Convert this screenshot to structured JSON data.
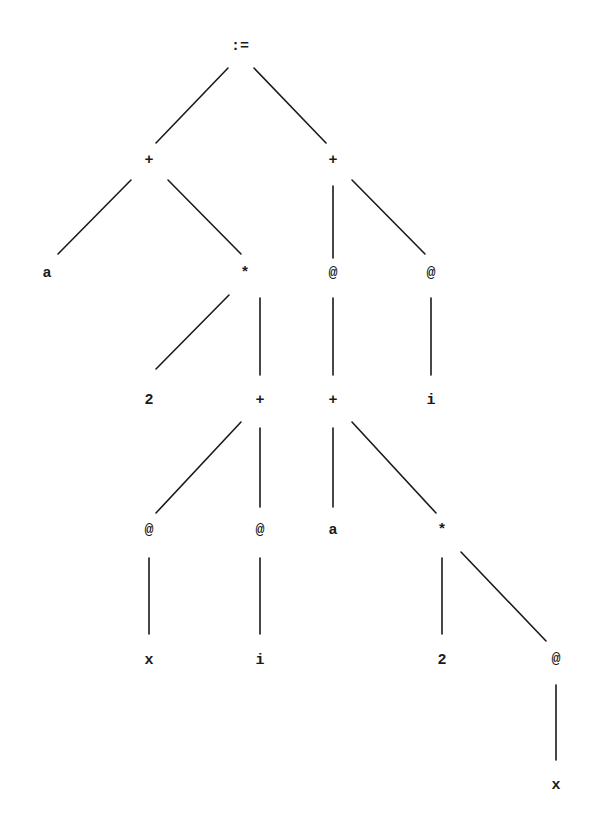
{
  "diagram": {
    "type": "abstract-syntax-tree",
    "nodes": [
      {
        "id": "n0",
        "label": ":=",
        "x": 240,
        "y": 46
      },
      {
        "id": "n1",
        "label": "+",
        "x": 149,
        "y": 160
      },
      {
        "id": "n2",
        "label": "+",
        "x": 333,
        "y": 160
      },
      {
        "id": "n3",
        "label": "a",
        "x": 47,
        "y": 273
      },
      {
        "id": "n4",
        "label": "*",
        "x": 245,
        "y": 273
      },
      {
        "id": "n5",
        "label": "@",
        "x": 333,
        "y": 273
      },
      {
        "id": "n6",
        "label": "@",
        "x": 431,
        "y": 273
      },
      {
        "id": "n7",
        "label": "2",
        "x": 149,
        "y": 400
      },
      {
        "id": "n8",
        "label": "+",
        "x": 260,
        "y": 400
      },
      {
        "id": "n9",
        "label": "+",
        "x": 333,
        "y": 400
      },
      {
        "id": "n10",
        "label": "i",
        "x": 431,
        "y": 400
      },
      {
        "id": "n11",
        "label": "@",
        "x": 149,
        "y": 530
      },
      {
        "id": "n12",
        "label": "@",
        "x": 260,
        "y": 530
      },
      {
        "id": "n13",
        "label": "a",
        "x": 333,
        "y": 530
      },
      {
        "id": "n14",
        "label": "*",
        "x": 442,
        "y": 530
      },
      {
        "id": "n15",
        "label": "x",
        "x": 149,
        "y": 660
      },
      {
        "id": "n16",
        "label": "i",
        "x": 260,
        "y": 660
      },
      {
        "id": "n17",
        "label": "2",
        "x": 442,
        "y": 660
      },
      {
        "id": "n18",
        "label": "@",
        "x": 556,
        "y": 659
      },
      {
        "id": "n19",
        "label": "x",
        "x": 556,
        "y": 785
      }
    ],
    "edges": [
      {
        "from": "n0",
        "to": "n1",
        "x1": 228,
        "y1": 68,
        "x2": 156,
        "y2": 143
      },
      {
        "from": "n0",
        "to": "n2",
        "x1": 254,
        "y1": 68,
        "x2": 326,
        "y2": 143
      },
      {
        "from": "n1",
        "to": "n3",
        "x1": 131,
        "y1": 180,
        "x2": 58,
        "y2": 254
      },
      {
        "from": "n1",
        "to": "n4",
        "x1": 168,
        "y1": 180,
        "x2": 241,
        "y2": 254
      },
      {
        "from": "n2",
        "to": "n5",
        "x1": 333,
        "y1": 186,
        "x2": 333,
        "y2": 258
      },
      {
        "from": "n2",
        "to": "n6",
        "x1": 352,
        "y1": 180,
        "x2": 425,
        "y2": 254
      },
      {
        "from": "n4",
        "to": "n7",
        "x1": 229,
        "y1": 295,
        "x2": 156,
        "y2": 369
      },
      {
        "from": "n4",
        "to": "n8",
        "x1": 260,
        "y1": 298,
        "x2": 260,
        "y2": 375
      },
      {
        "from": "n5",
        "to": "n9",
        "x1": 333,
        "y1": 298,
        "x2": 333,
        "y2": 375
      },
      {
        "from": "n6",
        "to": "n10",
        "x1": 431,
        "y1": 298,
        "x2": 431,
        "y2": 375
      },
      {
        "from": "n8",
        "to": "n11",
        "x1": 241,
        "y1": 422,
        "x2": 156,
        "y2": 513
      },
      {
        "from": "n8",
        "to": "n12",
        "x1": 260,
        "y1": 428,
        "x2": 260,
        "y2": 507
      },
      {
        "from": "n9",
        "to": "n13",
        "x1": 333,
        "y1": 428,
        "x2": 333,
        "y2": 507
      },
      {
        "from": "n9",
        "to": "n14",
        "x1": 352,
        "y1": 422,
        "x2": 436,
        "y2": 513
      },
      {
        "from": "n11",
        "to": "n15",
        "x1": 149,
        "y1": 558,
        "x2": 149,
        "y2": 634
      },
      {
        "from": "n12",
        "to": "n16",
        "x1": 260,
        "y1": 558,
        "x2": 260,
        "y2": 634
      },
      {
        "from": "n14",
        "to": "n17",
        "x1": 442,
        "y1": 558,
        "x2": 442,
        "y2": 634
      },
      {
        "from": "n14",
        "to": "n18",
        "x1": 461,
        "y1": 552,
        "x2": 546,
        "y2": 641
      },
      {
        "from": "n18",
        "to": "n19",
        "x1": 556,
        "y1": 685,
        "x2": 556,
        "y2": 760
      }
    ]
  }
}
